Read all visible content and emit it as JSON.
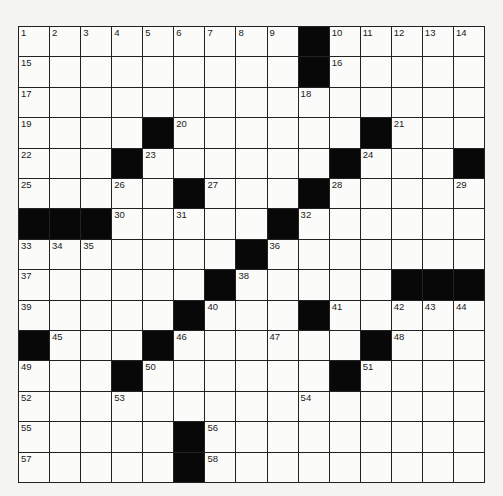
{
  "puzzle": {
    "rows": 15,
    "cols": 15,
    "grid": [
      [
        "1",
        "2",
        "3",
        "4",
        "5",
        "6",
        "7",
        "8",
        "9",
        "#",
        "10",
        "11",
        "12",
        "13",
        "14"
      ],
      [
        "15",
        "",
        "",
        "",
        "",
        "",
        "",
        "",
        "",
        "#",
        "16",
        "",
        "",
        "",
        ""
      ],
      [
        "17",
        "",
        "",
        "",
        "",
        "",
        "",
        "",
        "",
        "18",
        "",
        "",
        "",
        "",
        ""
      ],
      [
        "19",
        "",
        "",
        "",
        "#",
        "20",
        "",
        "",
        "",
        "",
        "",
        "#",
        "21",
        "",
        ""
      ],
      [
        "22",
        "",
        "",
        "#",
        "23",
        "",
        "",
        "",
        "",
        "",
        "#",
        "24",
        "",
        "",
        "#"
      ],
      [
        "25",
        "",
        "",
        "26",
        "",
        "#",
        "27",
        "",
        "",
        "#",
        "28",
        "",
        "",
        "",
        "29"
      ],
      [
        "#",
        "#",
        "#",
        "30",
        "",
        "31",
        "",
        "",
        "#",
        "32",
        "",
        "",
        "",
        "",
        ""
      ],
      [
        "33",
        "34",
        "35",
        "",
        "",
        "",
        "",
        "#",
        "36",
        "",
        "",
        "",
        "",
        "",
        ""
      ],
      [
        "37",
        "",
        "",
        "",
        "",
        "",
        "#",
        "38",
        "",
        "",
        "",
        "",
        "#",
        "#",
        "#"
      ],
      [
        "39",
        "",
        "",
        "",
        "",
        "#",
        "40",
        "",
        "",
        "#",
        "41",
        "",
        "42",
        "43",
        "44"
      ],
      [
        "#",
        "45",
        "",
        "",
        "#",
        "46",
        "",
        "",
        "47",
        "",
        "",
        "#",
        "48",
        "",
        ""
      ],
      [
        "49",
        "",
        "",
        "#",
        "50",
        "",
        "",
        "",
        "",
        "",
        "#",
        "51",
        "",
        "",
        ""
      ],
      [
        "52",
        "",
        "",
        "53",
        "",
        "",
        "",
        "",
        "",
        "54",
        "",
        "",
        "",
        "",
        ""
      ],
      [
        "55",
        "",
        "",
        "",
        "",
        "#",
        "56",
        "",
        "",
        "",
        "",
        "",
        "",
        "",
        ""
      ],
      [
        "57",
        "",
        "",
        "",
        "",
        "#",
        "58",
        "",
        "",
        "",
        "",
        "",
        "",
        "",
        ""
      ]
    ]
  },
  "colors": {
    "black_square": "#080808",
    "white_square": "#fbfbf9",
    "grid_line": "#222222"
  }
}
